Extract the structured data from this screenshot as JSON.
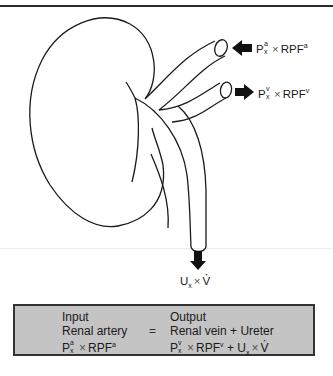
{
  "figure": {
    "inputs": {
      "artery_label": {
        "base": "P",
        "sup": "a",
        "sub": "x",
        "times": "×",
        "rpf": "RPF",
        "rpf_sup": "a"
      },
      "vein_label": {
        "base": "P",
        "sup": "v",
        "sub": "x",
        "times": "×",
        "rpf": "RPF",
        "rpf_sup": "v"
      },
      "ureter_label": {
        "base": "U",
        "sub": "x",
        "times": "×",
        "v": "V"
      }
    },
    "colors": {
      "line": "#1a1a1a",
      "arrow": "#111111",
      "box_fill": "#c4c4c4",
      "box_border": "#333333"
    }
  },
  "equation_box": {
    "left_column": {
      "heading": "Input",
      "line2": "Renal artery",
      "formula": {
        "base": "P",
        "sup": "a",
        "sub": "x",
        "times": "×",
        "rpf": "RPF",
        "rpf_sup": "a"
      }
    },
    "equals": "=",
    "right_column": {
      "heading": "Output",
      "line2": "Renal vein + Ureter",
      "formula": {
        "base": "P",
        "sup": "v",
        "sub": "x",
        "times": "×",
        "rpf": "RPF",
        "rpf_sup": "v",
        "plus": "+",
        "u": "U",
        "u_sub": "x",
        "times2": "×",
        "v": "V"
      }
    }
  }
}
